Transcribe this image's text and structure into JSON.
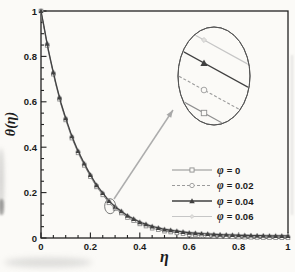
{
  "figure": {
    "width": 295,
    "height": 272,
    "background": "#fbfaf7",
    "axis_color": "#222222",
    "tick_label_color": "#1a1a1a"
  },
  "chart_data": {
    "type": "line",
    "title": "",
    "xlabel": "η",
    "ylabel": "θ(η)",
    "xlim": [
      0,
      1
    ],
    "ylim": [
      0,
      1
    ],
    "grid": false,
    "legend_position": "lower right",
    "x_major_ticks": [
      0,
      0.2,
      0.4,
      0.6,
      0.8,
      1
    ],
    "x_tick_labels": [
      "0",
      "0.2",
      "0.4",
      "0.6",
      "0.8",
      "1"
    ],
    "y_major_ticks": [
      0,
      0.2,
      0.4,
      0.6,
      0.8,
      1
    ],
    "y_tick_labels": [
      "0",
      "0.2",
      "0.4",
      "0.6",
      "0.8",
      "1"
    ],
    "minor_tick_step": 0.05,
    "x": [
      0,
      0.015,
      0.03,
      0.045,
      0.06,
      0.08,
      0.1,
      0.125,
      0.15,
      0.175,
      0.2,
      0.225,
      0.25,
      0.275,
      0.3,
      0.35,
      0.4,
      0.45,
      0.5,
      0.6,
      0.7,
      0.8,
      0.9,
      1.0
    ],
    "base_theta": [
      1.0,
      0.905,
      0.82,
      0.745,
      0.675,
      0.59,
      0.52,
      0.44,
      0.375,
      0.32,
      0.27,
      0.225,
      0.19,
      0.155,
      0.13,
      0.09,
      0.062,
      0.043,
      0.03,
      0.015,
      0.008,
      0.004,
      0.002,
      0.001
    ],
    "marker_step": 0.025,
    "series": [
      {
        "label_symbol": "φ",
        "label_value": "= 0",
        "marker": "square",
        "color": "#8f8f8f",
        "dash": null,
        "offset": 0.0
      },
      {
        "label_symbol": "φ",
        "label_value": "= 0.02",
        "marker": "circle",
        "color": "#9b9b9b",
        "dash": "3,2",
        "offset": 0.004
      },
      {
        "label_symbol": "φ",
        "label_value": "= 0.04",
        "marker": "triangle",
        "color": "#404040",
        "dash": null,
        "offset": 0.008
      },
      {
        "label_symbol": "φ",
        "label_value": "= 0.06",
        "marker": "diamond",
        "color": "#c6c6c6",
        "dash": null,
        "offset": 0.012
      }
    ]
  },
  "annotations": {
    "zoom_inset": {
      "description": "magnified ellipse view of the four overlapping curves",
      "circled_point": {
        "eta": 0.28,
        "theta": 0.14
      }
    }
  }
}
